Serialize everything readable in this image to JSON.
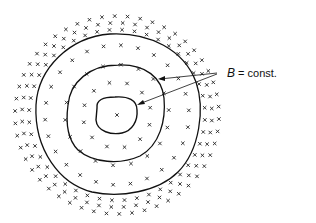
{
  "diagram": {
    "label_symbol": "B",
    "label_rest": " = const.",
    "contours": 3
  }
}
